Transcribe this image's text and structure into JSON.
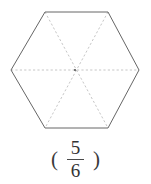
{
  "figure": {
    "name": "hexagon-divided-into-sixths",
    "shape": "hexagon",
    "total_parts": 6,
    "shaded_parts": 0,
    "outline_color": "#666666",
    "divider_color": "#bfbfbf",
    "background_color": "#ffffff",
    "text_color": "#333333",
    "vertices": [
      [
        45,
        12
      ],
      [
        108,
        12
      ],
      [
        139,
        70
      ],
      [
        108,
        128
      ],
      [
        45,
        128
      ],
      [
        11,
        70
      ]
    ],
    "center": [
      75,
      70
    ]
  },
  "label": {
    "open_paren": "(",
    "close_paren": ")",
    "numerator": "5",
    "denominator": "6",
    "fraction_text": "5/6"
  }
}
